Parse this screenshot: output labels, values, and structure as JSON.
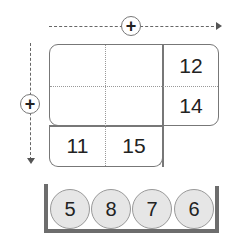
{
  "operators": {
    "horizontal": "+",
    "vertical": "+"
  },
  "grid": {
    "right_column": [
      "12",
      "14"
    ],
    "bottom_row": [
      "11",
      "15"
    ],
    "empty_cells": 4
  },
  "tray": {
    "balls": [
      "5",
      "8",
      "7",
      "6"
    ]
  },
  "colors": {
    "line": "#777777",
    "ball_fill": "#e6e6e6",
    "tray": "#6d6d6d"
  }
}
